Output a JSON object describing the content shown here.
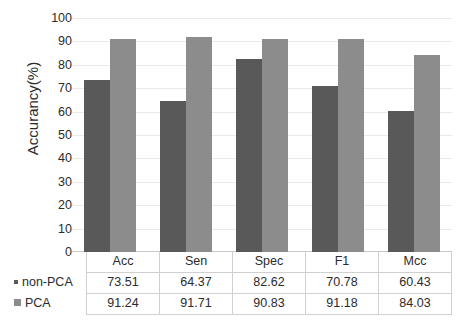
{
  "chart_data": {
    "type": "bar",
    "title": "",
    "xlabel": "",
    "ylabel": "Accurancy(%)",
    "ylim": [
      0,
      100
    ],
    "ytick_step": 10,
    "ytick_labels": [
      "100",
      "90",
      "80",
      "70",
      "60",
      "50",
      "40",
      "30",
      "20",
      "10",
      "0"
    ],
    "grid": true,
    "legend_position": "table-row-headers",
    "categories": [
      "Acc",
      "Sen",
      "Spec",
      "F1",
      "Mcc"
    ],
    "series": [
      {
        "name": "non-PCA",
        "color": "#595959",
        "values": [
          73.51,
          64.37,
          82.62,
          70.78,
          60.43
        ],
        "value_labels": [
          "73.51",
          "64.37",
          "82.62",
          "70.78",
          "60.43"
        ]
      },
      {
        "name": "PCA",
        "color": "#8c8c8c",
        "values": [
          91.24,
          91.71,
          90.83,
          91.18,
          84.03
        ],
        "value_labels": [
          "91.24",
          "91.71",
          "90.83",
          "91.18",
          "84.03"
        ]
      }
    ]
  },
  "table": {
    "corner_label": "",
    "column_headers": [
      "Acc",
      "Sen",
      "Spec",
      "F1",
      "Mcc"
    ],
    "rows": [
      {
        "legend_label": "non-PCA",
        "swatch": "square-dark-icon",
        "cells": [
          "73.51",
          "64.37",
          "82.62",
          "70.78",
          "60.43"
        ]
      },
      {
        "legend_label": "PCA",
        "swatch": "square-light-icon",
        "cells": [
          "91.24",
          "91.71",
          "90.83",
          "91.18",
          "84.03"
        ]
      }
    ]
  },
  "colors": {
    "series_non_pca": "#595959",
    "series_pca": "#8c8c8c",
    "gridline": "#e9e9e9",
    "table_border": "#d0d0d0",
    "text": "#2b2b2b",
    "background": "#ffffff"
  }
}
